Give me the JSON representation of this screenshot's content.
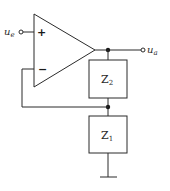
{
  "diagram": {
    "type": "non-inverting-amplifier-circuit",
    "opamp": {
      "plus_sign": "+",
      "minus_sign": "−"
    },
    "input": {
      "label_main": "u",
      "label_sub": "e"
    },
    "output": {
      "label_main": "u",
      "label_sub": "a"
    },
    "impedances": [
      {
        "label_main": "Z",
        "label_sub": "2"
      },
      {
        "label_main": "Z",
        "label_sub": "1"
      }
    ],
    "colors": {
      "line": "#2b2b2b",
      "background": "#ffffff"
    }
  }
}
